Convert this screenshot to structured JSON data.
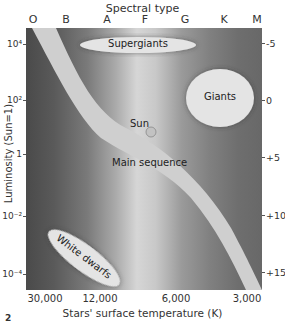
{
  "diagram": {
    "type": "Hertzsprung-Russell diagram",
    "figure_number": "2",
    "top_axis": {
      "title": "Spectral type",
      "labels": [
        "O",
        "B",
        "A",
        "F",
        "G",
        "K",
        "M"
      ]
    },
    "left_axis": {
      "title": "Luminosity (Sun=1)",
      "ticks": [
        {
          "label": "10⁴"
        },
        {
          "label": "10²"
        },
        {
          "label": "1"
        },
        {
          "label": "10⁻²"
        },
        {
          "label": "10⁻⁴"
        }
      ]
    },
    "right_axis": {
      "ticks": [
        "-5",
        "0",
        "+5",
        "+10",
        "+15"
      ]
    },
    "bottom_axis": {
      "title": "Stars' surface temperature (K)",
      "ticks": [
        "30,000",
        "12,000",
        "6,000",
        "3,000"
      ]
    },
    "regions": {
      "supergiants": "Supergiants",
      "giants": "Giants",
      "main_sequence": "Main sequence",
      "white_dwarfs": "White dwarfs",
      "sun": "Sun"
    },
    "colors": {
      "region_fill": "#e2e2e2",
      "band_fill": "#d0d0d0",
      "background_dark": "#4a4a4a",
      "background_light": "#d6d6d6"
    }
  }
}
